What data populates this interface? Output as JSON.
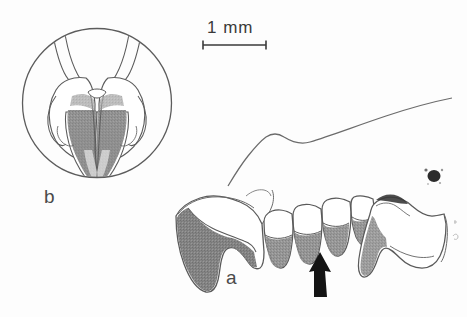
{
  "figure": {
    "type": "scientific-illustration",
    "background_color": "#fdfdfd",
    "ink_color": "#4a4a4a",
    "shading_color": "#8a8a8a",
    "shading_color_dark": "#787878",
    "arrow_color": "#1a1a1a",
    "width": 467,
    "height": 317
  },
  "scale_bar": {
    "label": "1 mm",
    "label_x": 207,
    "label_y": 18,
    "bar_x_start": 203,
    "bar_x_end": 266,
    "bar_y": 45,
    "cap_height": 9,
    "color": "#3a3a3a"
  },
  "panels": [
    {
      "id": "b",
      "label": "b",
      "name": "inset-panel-b",
      "description": "circular inset showing paired anterior incisors in occlusal/anterior view with gray shaded distal halves",
      "label_x": 44,
      "label_y": 186,
      "circle": {
        "cx": 97,
        "cy": 103,
        "r": 75
      }
    },
    {
      "id": "a",
      "label": "a",
      "name": "main-panel-a",
      "description": "lateral view of jaw fragment with procumbent incisor and cheek tooth row, gray shading indicates pigmented enamel",
      "label_x": 226,
      "label_y": 267
    }
  ],
  "annotations": [
    {
      "name": "pointer-arrow",
      "type": "arrow",
      "direction": "up",
      "tip_x": 320,
      "tip_y": 252,
      "tail_y": 297,
      "color": "#1a1a1a",
      "description": "solid black arrow indicating a specific cheek tooth"
    },
    {
      "name": "ink-speck",
      "type": "artifact",
      "x": 434,
      "y": 175,
      "description": "small dark ink blot on the scan"
    }
  ],
  "teeth": [
    {
      "name": "incisor",
      "shading": "heavy"
    },
    {
      "name": "cheek-tooth-1",
      "shading": "partial"
    },
    {
      "name": "cheek-tooth-2",
      "shading": "partial"
    },
    {
      "name": "cheek-tooth-3",
      "shading": "partial"
    },
    {
      "name": "cheek-tooth-4",
      "shading": "partial"
    },
    {
      "name": "posterior-element",
      "shading": "partial"
    }
  ]
}
